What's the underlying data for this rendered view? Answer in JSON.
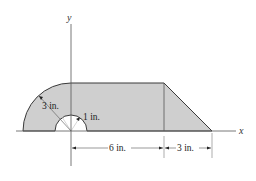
{
  "diagram": {
    "type": "composite-area-figure",
    "axes": {
      "x_label": "x",
      "y_label": "y"
    },
    "colors": {
      "fill": "#cfcfcf",
      "stroke": "#333333",
      "axis": "#555555",
      "background": "#ffffff"
    },
    "labels": {
      "outer_radius": "3 in.",
      "inner_radius": "1 in.",
      "rect_width": "6 in.",
      "triangle_width": "3 in."
    },
    "shapes": [
      {
        "name": "quarter-circle",
        "radius": "3 in."
      },
      {
        "name": "rectangle",
        "width": "6 in.",
        "height": "3 in."
      },
      {
        "name": "triangle",
        "base": "3 in.",
        "height": "3 in."
      },
      {
        "name": "semicircular-hole",
        "radius": "1 in."
      }
    ]
  }
}
